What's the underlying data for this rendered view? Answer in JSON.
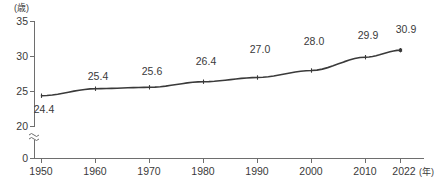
{
  "chart_data": {
    "type": "line",
    "title": "",
    "subtitle": "",
    "xlabel": "(年)",
    "ylabel": "(歳)",
    "x": [
      1950,
      1960,
      1970,
      1980,
      1990,
      2000,
      2010,
      2022
    ],
    "values": [
      24.4,
      25.4,
      25.6,
      26.4,
      27.0,
      28.0,
      29.9,
      30.9
    ],
    "point_labels": [
      "24.4",
      "25.4",
      "25.6",
      "26.4",
      "27.0",
      "28.0",
      "29.9",
      "30.9"
    ],
    "categories": [
      "1950",
      "1960",
      "1970",
      "1980",
      "1990",
      "2000",
      "2010",
      "2022"
    ],
    "xtick_labels": [
      "1950",
      "1960",
      "1970",
      "1980",
      "1990",
      "2000",
      "2010",
      "2022"
    ],
    "ytick_labels": [
      "35",
      "30",
      "25",
      "20",
      "0"
    ],
    "ytick_values": [
      35,
      30,
      25,
      20,
      0
    ],
    "ylim": [
      20,
      35
    ],
    "xlim": [
      1950,
      2022
    ],
    "axis_break": true,
    "axis_break_symbol": "≈",
    "grid": false,
    "legend": null,
    "legend_position": "none",
    "series": [
      {
        "name": "",
        "values": [
          24.4,
          25.4,
          25.6,
          26.4,
          27.0,
          28.0,
          29.9,
          30.9
        ],
        "color": "#3a3a3a",
        "marker": "tick"
      }
    ],
    "colors": {
      "line": "#3a3a3a",
      "axis": "#6e6e6e",
      "text": "#3a3a3a",
      "background": "#ffffff"
    }
  },
  "axis": {
    "y_unit": "(歳)",
    "x_unit": "(年)",
    "zero_label": "0"
  }
}
